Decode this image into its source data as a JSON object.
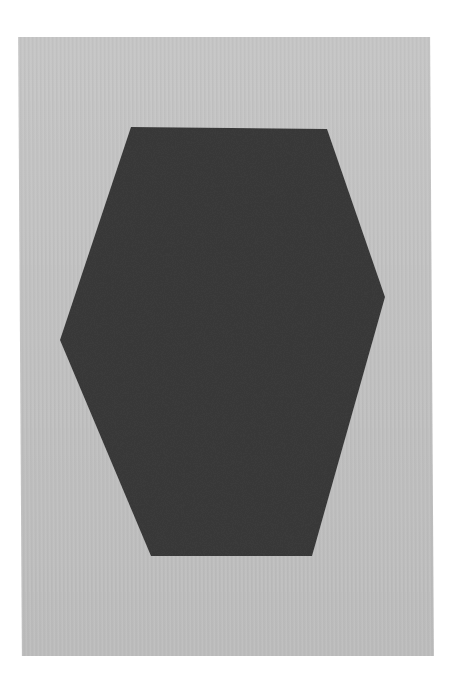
{
  "artwork": {
    "background_color": "#ffffff",
    "panel_color": "#c2c2c2",
    "shape_color": "#3a3a3a",
    "shape": "hexagon",
    "shape_points": [
      [
        131,
        127
      ],
      [
        327,
        129
      ],
      [
        385,
        297
      ],
      [
        312,
        556
      ],
      [
        151,
        556
      ],
      [
        60,
        340
      ]
    ]
  }
}
